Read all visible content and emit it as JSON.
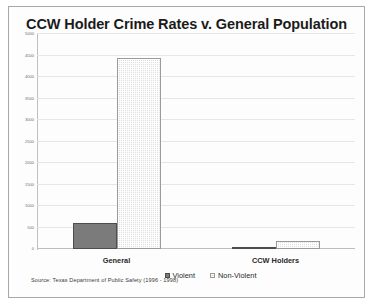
{
  "chart_data": {
    "type": "bar",
    "title": "CCW Holder Crime Rates v. General Population",
    "xlabel": "",
    "ylabel": "",
    "categories": [
      "General",
      "CCW Holders"
    ],
    "series": [
      {
        "name": "Violent",
        "values": [
          600,
          50
        ],
        "color": "#7b7b7b"
      },
      {
        "name": "Non-Violent",
        "values": [
          4450,
          180
        ],
        "color": "#dedede"
      }
    ],
    "ylim": [
      0,
      5000
    ],
    "ytick_step": 500,
    "yticks": [
      0,
      500,
      1000,
      1500,
      2000,
      2500,
      3000,
      3500,
      4000,
      4500,
      5000
    ],
    "ytick_labels": [
      "0",
      "500",
      "1000",
      "1500",
      "2000",
      "2500",
      "3000",
      "3500",
      "4000",
      "4500",
      "5000"
    ],
    "grid": true,
    "legend_position": "bottom",
    "annotations": [
      "Source:  Texas Department of Public Safety (1996 - 1998)"
    ]
  },
  "source_note": "Source:  Texas Department of Public Safety (1996 - 1998)",
  "colors": {
    "violent": "#7b7b7b",
    "nonviolent": "#dedede",
    "grid": "#e6e6e6",
    "axis": "#bfbfbf",
    "title": "#1b1b1b",
    "frame": "#a8a8a8"
  }
}
